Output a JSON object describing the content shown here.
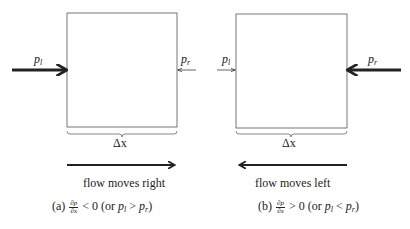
{
  "panels": [
    {
      "id": "a",
      "left_pressure_label": "p",
      "left_pressure_sub": "l",
      "right_pressure_label": "p",
      "right_pressure_sub": "r",
      "width_label": "Δx",
      "flow_label": "flow moves right",
      "caption_prefix": "(a)",
      "caption_frac_num": "∂p",
      "caption_frac_den": "∂x",
      "caption_relation": "< 0 (or",
      "caption_p1": "p",
      "caption_p1_sub": "l",
      "caption_op": ">",
      "caption_p2": "p",
      "caption_p2_sub": "r",
      "caption_close": ")",
      "strong_side": "left",
      "flow_direction": "right"
    },
    {
      "id": "b",
      "left_pressure_label": "p",
      "left_pressure_sub": "l",
      "right_pressure_label": "p",
      "right_pressure_sub": "r",
      "width_label": "Δx",
      "flow_label": "flow moves left",
      "caption_prefix": "(b)",
      "caption_frac_num": "∂p",
      "caption_frac_den": "∂x",
      "caption_relation": "> 0 (or",
      "caption_p1": "p",
      "caption_p1_sub": "l",
      "caption_op": "<",
      "caption_p2": "p",
      "caption_p2_sub": "r",
      "caption_close": ")",
      "strong_side": "right",
      "flow_direction": "left"
    }
  ],
  "colors": {
    "stroke": "#222222",
    "box": "#555555"
  }
}
